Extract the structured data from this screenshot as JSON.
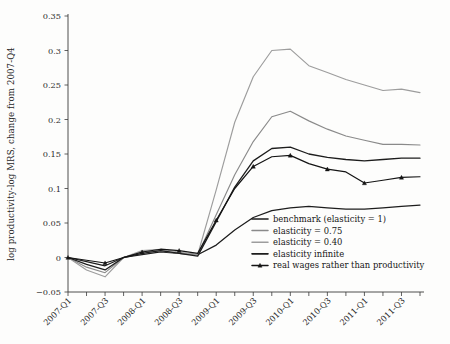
{
  "chart_data": {
    "type": "line",
    "title": "",
    "xlabel": "",
    "ylabel": "log productivity-log MRS, change from 2007-Q4",
    "ylim": [
      -0.05,
      0.35
    ],
    "ytick_values": [
      -0.05,
      0,
      0.05,
      0.1,
      0.15,
      0.2,
      0.25,
      0.3,
      0.35
    ],
    "ytick_labels": [
      "−0.05",
      "0",
      "0.05",
      "0.1",
      "0.15",
      "0.2",
      "0.25",
      "0.3",
      "0.35"
    ],
    "grid": false,
    "legend_position": "lower-right",
    "categories": [
      "2007-Q1",
      "2007-Q2",
      "2007-Q3",
      "2007-Q4",
      "2008-Q1",
      "2008-Q2",
      "2008-Q3",
      "2008-Q4",
      "2009-Q1",
      "2009-Q2",
      "2009-Q3",
      "2009-Q4",
      "2010-Q1",
      "2010-Q2",
      "2010-Q3",
      "2010-Q4",
      "2011-Q1",
      "2011-Q2",
      "2011-Q3",
      "2011-Q4"
    ],
    "xtick_labels": [
      "2007-Q1",
      "",
      "2007-Q3",
      "",
      "2008-Q1",
      "",
      "2008-Q3",
      "",
      "2009-Q1",
      "",
      "2009-Q3",
      "",
      "2010-Q1",
      "",
      "2010-Q3",
      "",
      "2011-Q1",
      "",
      "2011-Q3",
      ""
    ],
    "series": [
      {
        "name": "benchmark (elasticity = 1)",
        "color": "#1d1d1d",
        "width": 1.25,
        "marker": "none",
        "values": [
          0.0,
          -0.006,
          -0.012,
          0.0,
          0.004,
          0.008,
          0.006,
          0.004,
          0.018,
          0.04,
          0.058,
          0.068,
          0.072,
          0.074,
          0.072,
          0.07,
          0.07,
          0.072,
          0.074,
          0.076
        ]
      },
      {
        "name": "elasticity = 0.75",
        "color": "#8a8a8a",
        "width": 1.15,
        "marker": "none",
        "values": [
          0.0,
          -0.014,
          -0.022,
          0.0,
          0.008,
          0.01,
          0.006,
          0.004,
          0.062,
          0.12,
          0.168,
          0.204,
          0.212,
          0.198,
          0.186,
          0.176,
          0.17,
          0.164,
          0.164,
          0.163
        ]
      },
      {
        "name": "elasticity = 0.40",
        "color": "#9d9d9d",
        "width": 1.15,
        "marker": "none",
        "values": [
          0.0,
          -0.018,
          -0.028,
          0.0,
          0.01,
          0.012,
          0.008,
          0.004,
          0.098,
          0.196,
          0.262,
          0.3,
          0.302,
          0.278,
          0.268,
          0.258,
          0.25,
          0.242,
          0.244,
          0.239
        ]
      },
      {
        "name": "elasticity infinite",
        "color": "#1d1d1d",
        "width": 1.3,
        "marker": "none",
        "values": [
          0.0,
          -0.01,
          -0.018,
          0.0,
          0.006,
          0.01,
          0.006,
          0.002,
          0.052,
          0.102,
          0.14,
          0.158,
          0.16,
          0.15,
          0.145,
          0.142,
          0.14,
          0.142,
          0.144,
          0.144
        ]
      },
      {
        "name": "real wages rather than productivity",
        "color": "#141414",
        "width": 1.2,
        "marker": "triangle",
        "values": [
          0.0,
          -0.004,
          -0.008,
          0.0,
          0.008,
          0.012,
          0.01,
          0.006,
          0.054,
          0.1,
          0.132,
          0.146,
          0.148,
          0.136,
          0.128,
          0.124,
          0.108,
          0.112,
          0.116,
          0.117
        ]
      }
    ]
  }
}
